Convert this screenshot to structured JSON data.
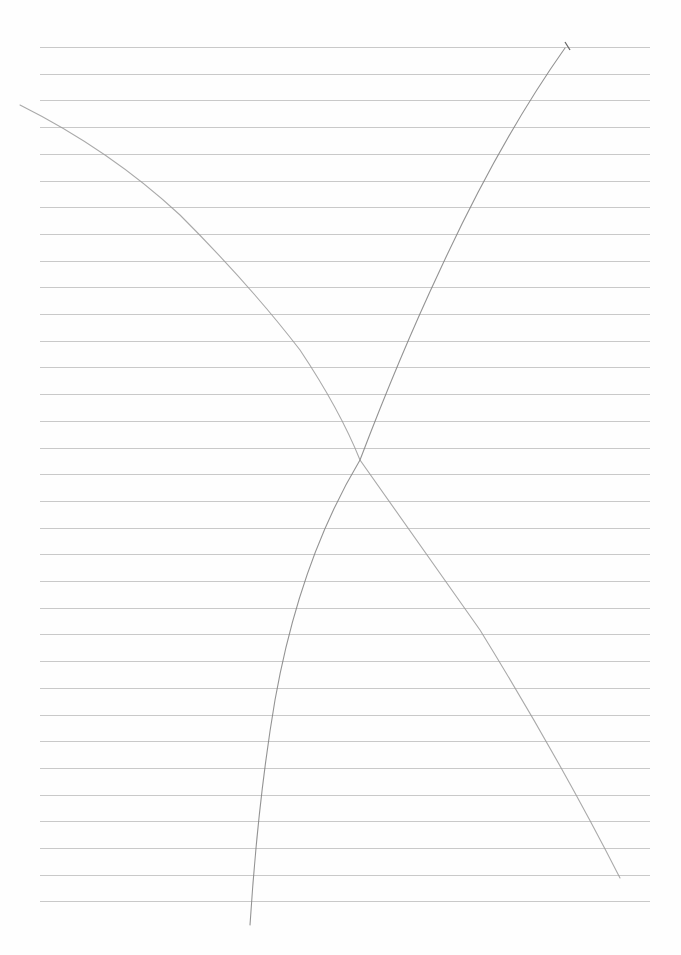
{
  "paper": {
    "type": "lined-paper",
    "background": "#fefefe",
    "rule_color": "#c9c9c9",
    "rule_count": 33,
    "first_rule_y": 47,
    "rule_spacing": 26.7,
    "rule_left": 40,
    "rule_right": 650
  },
  "strokes": [
    {
      "name": "pencil-curve-descending",
      "color": "#8a8a8a"
    },
    {
      "name": "pencil-curve-ascending",
      "color": "#7a7a7a"
    }
  ]
}
